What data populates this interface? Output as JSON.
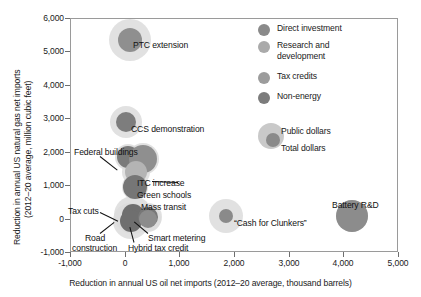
{
  "chart_data": {
    "type": "scatter",
    "title": "",
    "xlabel": "Reduction in annual US oil net imports (2012–20 average, thousand barrels)",
    "ylabel_line1": "Reduction in annual US natural gas net imports",
    "ylabel_line2": "(2012–20 average, million cubic feet)",
    "xlim": [
      -1000,
      5000
    ],
    "ylim": [
      -1000,
      6000
    ],
    "xticks": [
      "-1,000",
      "0",
      "1,000",
      "2,000",
      "3,000",
      "4,000",
      "5,000"
    ],
    "xtick_values": [
      -1000,
      0,
      1000,
      2000,
      3000,
      4000,
      5000
    ],
    "yticks": [
      "6,000",
      "5,000",
      "4,000",
      "3,000",
      "2,000",
      "1,000",
      "0",
      "-1,000"
    ],
    "ytick_values": [
      6000,
      5000,
      4000,
      3000,
      2000,
      1000,
      0,
      -1000
    ],
    "grid": false,
    "legend_position": "top-right",
    "bubble_meaning": {
      "outer": "Public dollars",
      "inner": "Total dollars"
    },
    "categories": [
      {
        "name": "Direct investment",
        "color": "#8a8a8a"
      },
      {
        "name": "Research and development",
        "color": "#a8a8a8"
      },
      {
        "name": "Tax credits",
        "color": "#9b9b9b"
      },
      {
        "name": "Non-energy",
        "color": "#7e7e7e"
      }
    ],
    "points": [
      {
        "label": "PTC extension",
        "x": 100,
        "y": 5350,
        "public_r": 21,
        "total_r": 12,
        "category": "Tax credits",
        "color": "#8f8f8f"
      },
      {
        "label": "CCS demonstration",
        "x": 20,
        "y": 2900,
        "public_r": 16,
        "total_r": 10,
        "category": "Direct investment",
        "color": "#7d7d7d"
      },
      {
        "label": "Federal buildings",
        "x": 60,
        "y": 1850,
        "public_r": 13,
        "total_r": 11,
        "category": "Direct investment",
        "color": "#7a7a7a"
      },
      {
        "label": "ITC increase",
        "x": 330,
        "y": 1790,
        "public_r": 16,
        "total_r": 14,
        "category": "Tax credits",
        "color": "#8f8f8f"
      },
      {
        "label": "Green schools",
        "x": 200,
        "y": 1380,
        "public_r": 14,
        "total_r": 11,
        "category": "Research and development",
        "color": "#b4b4b4"
      },
      {
        "label": "Mass transit",
        "x": 190,
        "y": 930,
        "public_r": 13,
        "total_r": 12,
        "category": "Direct investment",
        "color": "#767676"
      },
      {
        "label": "Tax cuts",
        "x": 150,
        "y": 120,
        "public_r": 19,
        "total_r": 11,
        "category": "Non-energy",
        "color": "#6f6f6f"
      },
      {
        "label": "Road construction",
        "x": 120,
        "y": -80,
        "public_r": 18,
        "total_r": 11,
        "category": "Non-energy",
        "color": "#6f6f6f"
      },
      {
        "label": "Smart metering",
        "x": 430,
        "y": 60,
        "public_r": 14,
        "total_r": 10,
        "category": "Direct investment",
        "color": "#777777"
      },
      {
        "label": "Hybrid tax credit",
        "x": 420,
        "y": -10,
        "public_r": 13,
        "total_r": 9,
        "category": "Tax credits",
        "color": "#8c8c8c"
      },
      {
        "label": "“Cash for Clunkers”",
        "x": 1860,
        "y": 75,
        "public_r": 17,
        "total_r": 7,
        "category": "Non-energy",
        "color": "#8a8a8a"
      },
      {
        "label": "Battery R&D",
        "x": 4150,
        "y": 80,
        "public_r": 16,
        "total_r": 16,
        "category": "Research and development",
        "color": "#8c8c8c"
      }
    ]
  },
  "legend": {
    "items": [
      {
        "label": "Direct investment",
        "color": "#8a8a8a"
      },
      {
        "label": "Research and",
        "label2": "development",
        "color": "#aaaaaa"
      },
      {
        "label": "Tax credits",
        "color": "#9c9c9c"
      },
      {
        "label": "Non-energy",
        "color": "#7c7c7c"
      }
    ],
    "size_key": {
      "outer_label": "Public dollars",
      "inner_label": "Total dollars"
    }
  }
}
